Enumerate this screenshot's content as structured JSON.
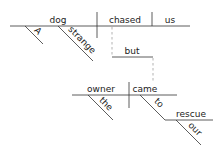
{
  "diagram": {
    "type": "sentence-diagram",
    "style": "Reed-Kellogg",
    "sentence_words": [
      "A",
      "strange",
      "dog",
      "chased",
      "us",
      "but",
      "owner",
      "the",
      "came",
      "to",
      "rescue",
      "our"
    ],
    "clause1": {
      "subject": "dog",
      "verb": "chased",
      "object": "us",
      "modifiers": [
        "A",
        "strange"
      ]
    },
    "conjunction": "but",
    "clause2": {
      "subject": "owner",
      "verb": "came",
      "subject_modifiers": [
        "the"
      ],
      "preposition": "to",
      "prep_object": "rescue",
      "prep_object_modifiers": [
        "our"
      ]
    },
    "colors": {
      "line": "#333333",
      "dashed": "#aaaaaa",
      "text": "#222222"
    }
  }
}
